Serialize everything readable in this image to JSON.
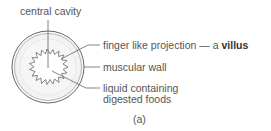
{
  "labels": {
    "central_cavity": "central cavity",
    "villus_prefix": "finger like projection — a ",
    "villus_bold": "villus",
    "muscular_wall": "muscular wall",
    "liquid_line1": "liquid containing",
    "liquid_line2": "digested foods"
  },
  "caption": "(a)"
}
